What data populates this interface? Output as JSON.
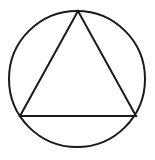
{
  "figure": {
    "canvas": {
      "width": 155,
      "height": 160,
      "background_color": "#ffffff"
    },
    "style": {
      "stroke_color": "#1a1a1a",
      "stroke_width": 2,
      "fill": "none"
    },
    "shapes": [
      {
        "name": "outer-circle",
        "type": "circle",
        "center_x": 77,
        "center_y": 79,
        "radius": 68,
        "stroke_width": 2
      },
      {
        "name": "inscribed-triangle",
        "type": "polygon",
        "points": "78,11 20,116 136,116",
        "vertices": [
          {
            "label": "apex",
            "x": 78,
            "y": 11
          },
          {
            "label": "base-left",
            "x": 20,
            "y": 116
          },
          {
            "label": "base-right",
            "x": 136,
            "y": 116
          }
        ],
        "stroke_width": 2
      }
    ]
  }
}
